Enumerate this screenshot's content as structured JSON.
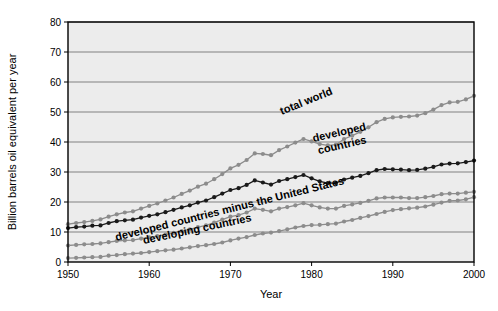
{
  "chart_data": {
    "type": "line",
    "title": "",
    "xlabel": "Year",
    "ylabel": "Billion barrels oil equivalent per year",
    "xlim": [
      1950,
      2000
    ],
    "ylim": [
      0,
      80
    ],
    "xticks": [
      "1950",
      "1960",
      "1970",
      "1980",
      "1990",
      "2000"
    ],
    "yticks": [
      "0",
      "10",
      "20",
      "30",
      "40",
      "50",
      "60",
      "70",
      "80"
    ],
    "grid": "horizontal",
    "legend_position": "inline-annotations",
    "plot_background": "#ececec",
    "x": [
      1950,
      1951,
      1952,
      1953,
      1954,
      1955,
      1956,
      1957,
      1958,
      1959,
      1960,
      1961,
      1962,
      1963,
      1964,
      1965,
      1966,
      1967,
      1968,
      1969,
      1970,
      1971,
      1972,
      1973,
      1974,
      1975,
      1976,
      1977,
      1978,
      1979,
      1980,
      1981,
      1982,
      1983,
      1984,
      1985,
      1986,
      1987,
      1988,
      1989,
      1990,
      1991,
      1992,
      1993,
      1994,
      1995,
      1996,
      1997,
      1998,
      1999,
      2000
    ],
    "series": [
      {
        "name": "total world",
        "color": "#8c8c8c",
        "label_x": 1979.5,
        "label_y": 52.5,
        "label_rotation": -22,
        "values": [
          12.6,
          13.0,
          13.3,
          13.7,
          14.2,
          15.1,
          15.9,
          16.5,
          16.9,
          17.8,
          18.7,
          19.5,
          20.5,
          21.5,
          22.7,
          23.8,
          25.1,
          26.1,
          27.6,
          29.3,
          31.2,
          32.4,
          34.0,
          36.2,
          36.0,
          35.6,
          37.3,
          38.5,
          39.8,
          41.0,
          40.2,
          39.3,
          38.9,
          39.1,
          41.0,
          42.1,
          43.4,
          44.9,
          46.6,
          47.7,
          48.2,
          48.4,
          48.5,
          48.8,
          49.6,
          50.8,
          52.3,
          53.2,
          53.4,
          54.2,
          55.4
        ]
      },
      {
        "name": "developed countries",
        "color": "#1a1a1a",
        "label_x": 1983.5,
        "label_y": 42.0,
        "label_rotation": -13,
        "values": [
          11.3,
          11.6,
          11.8,
          12.1,
          12.2,
          13.0,
          13.6,
          13.9,
          14.1,
          14.8,
          15.4,
          15.9,
          16.6,
          17.4,
          18.2,
          18.9,
          19.8,
          20.5,
          21.6,
          22.8,
          24.0,
          24.6,
          25.7,
          27.2,
          26.5,
          25.8,
          27.0,
          27.6,
          28.3,
          29.0,
          27.9,
          26.9,
          26.3,
          26.3,
          27.5,
          28.1,
          28.7,
          29.6,
          30.6,
          31.0,
          30.9,
          30.8,
          30.6,
          30.7,
          31.1,
          31.7,
          32.5,
          32.8,
          32.9,
          33.3,
          33.8
        ]
      },
      {
        "name": "developed countries minus the United States",
        "color": "#8c8c8c",
        "label_x": 1970.0,
        "label_y": 16.5,
        "label_rotation": -14,
        "values": [
          5.5,
          5.7,
          5.9,
          6.0,
          6.2,
          6.6,
          7.0,
          7.2,
          7.3,
          7.8,
          8.2,
          8.6,
          9.1,
          9.7,
          10.3,
          10.9,
          11.6,
          12.2,
          13.1,
          14.1,
          15.1,
          15.6,
          16.5,
          17.8,
          17.4,
          16.9,
          17.8,
          18.3,
          18.9,
          19.6,
          18.9,
          18.2,
          17.8,
          17.8,
          18.7,
          19.2,
          19.7,
          20.4,
          21.2,
          21.5,
          21.5,
          21.5,
          21.3,
          21.3,
          21.6,
          22.0,
          22.6,
          22.8,
          22.8,
          23.1,
          23.4
        ]
      },
      {
        "name": "developing countries",
        "color": "#8c8c8c",
        "label_x": 1966.0,
        "label_y": 9.8,
        "label_rotation": -12,
        "values": [
          1.3,
          1.4,
          1.5,
          1.6,
          1.7,
          2.1,
          2.3,
          2.6,
          2.8,
          3.0,
          3.3,
          3.6,
          3.9,
          4.1,
          4.5,
          4.9,
          5.3,
          5.6,
          6.0,
          6.5,
          7.2,
          7.8,
          8.3,
          9.0,
          9.5,
          9.8,
          10.3,
          10.9,
          11.5,
          12.0,
          12.3,
          12.4,
          12.6,
          12.8,
          13.5,
          14.0,
          14.7,
          15.3,
          16.0,
          16.7,
          17.3,
          17.6,
          17.9,
          18.1,
          18.5,
          19.1,
          19.8,
          20.4,
          20.5,
          20.9,
          21.6
        ]
      }
    ]
  }
}
